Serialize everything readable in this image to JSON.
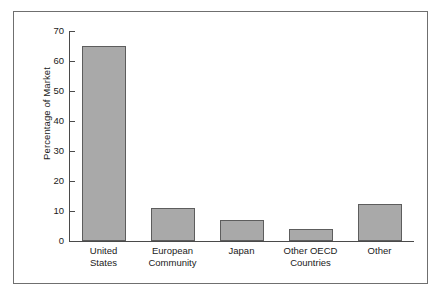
{
  "chart_data": {
    "type": "bar",
    "title": "",
    "xlabel": "",
    "ylabel": "Percentage of Market",
    "categories": [
      "United States",
      "European Community",
      "Japan",
      "Other OECD Countries",
      "Other"
    ],
    "category_lines": [
      [
        "United",
        "States"
      ],
      [
        "European",
        "Community"
      ],
      [
        "Japan",
        ""
      ],
      [
        "Other OECD",
        "Countries"
      ],
      [
        "Other",
        ""
      ]
    ],
    "values": [
      65,
      11,
      7,
      4,
      12.5
    ],
    "ylim": [
      0,
      70
    ],
    "yticks": [
      0,
      10,
      20,
      30,
      40,
      50,
      60,
      70
    ],
    "ytick_labels": [
      "0",
      "10",
      "20",
      "30",
      "40",
      "50",
      "60",
      "70"
    ],
    "grid": false,
    "legend": false,
    "bar_color": "#a9a9a9",
    "bar_edge_color": "#5d5d5d",
    "axis_color": "#4a4a4a",
    "frame_color": "#6f6f6f",
    "background_color": "#ffffff"
  }
}
